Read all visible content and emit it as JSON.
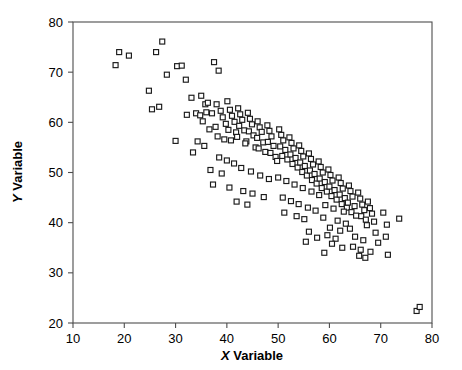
{
  "chart_data": {
    "type": "scatter",
    "title": "",
    "xlabel": "X Variable",
    "ylabel": "Y Variable",
    "xlabel_parts": {
      "italic": "X",
      "rest": " Variable"
    },
    "ylabel_parts": {
      "italic": "Y",
      "rest": " Variable"
    },
    "xlim": [
      10,
      80
    ],
    "ylim": [
      20,
      80
    ],
    "xticks": [
      10,
      20,
      30,
      40,
      50,
      60,
      70,
      80
    ],
    "yticks": [
      20,
      30,
      40,
      50,
      60,
      70,
      80
    ],
    "xtick_labels": [
      "10",
      "20",
      "30",
      "40",
      "50",
      "60",
      "70",
      "80"
    ],
    "ytick_labels": [
      "20",
      "30",
      "40",
      "50",
      "60",
      "70",
      "80"
    ],
    "grid": false,
    "legend": null,
    "marker": "open-square",
    "marker_size": 5,
    "marker_color": "#1a1a1a",
    "marker_fill": "#ffffff",
    "frame_color": "#4d4d4d",
    "correlation": "negative",
    "n_points": 202,
    "points": [
      [
        18.3,
        71.4
      ],
      [
        19.0,
        74.0
      ],
      [
        20.9,
        73.3
      ],
      [
        26.2,
        74.0
      ],
      [
        27.4,
        76.1
      ],
      [
        24.8,
        66.3
      ],
      [
        25.4,
        62.6
      ],
      [
        26.8,
        63.1
      ],
      [
        28.3,
        69.5
      ],
      [
        30.3,
        71.2
      ],
      [
        31.2,
        71.3
      ],
      [
        32.0,
        68.5
      ],
      [
        33.1,
        64.9
      ],
      [
        32.2,
        61.5
      ],
      [
        34.0,
        61.8
      ],
      [
        30.0,
        56.3
      ],
      [
        33.4,
        54.0
      ],
      [
        35.0,
        65.3
      ],
      [
        35.8,
        63.6
      ],
      [
        36.3,
        63.9
      ],
      [
        36.0,
        62.0
      ],
      [
        34.8,
        61.4
      ],
      [
        35.3,
        60.2
      ],
      [
        37.1,
        61.8
      ],
      [
        36.6,
        58.6
      ],
      [
        34.3,
        56.2
      ],
      [
        35.6,
        55.3
      ],
      [
        37.5,
        72.0
      ],
      [
        38.4,
        70.3
      ],
      [
        38.0,
        63.6
      ],
      [
        38.8,
        62.3
      ],
      [
        39.2,
        61.0
      ],
      [
        37.8,
        59.1
      ],
      [
        39.8,
        59.7
      ],
      [
        38.2,
        57.2
      ],
      [
        39.5,
        56.6
      ],
      [
        40.1,
        64.2
      ],
      [
        40.6,
        62.5
      ],
      [
        41.0,
        61.3
      ],
      [
        41.5,
        60.1
      ],
      [
        40.3,
        58.5
      ],
      [
        41.8,
        58.0
      ],
      [
        40.8,
        56.4
      ],
      [
        42.2,
        62.8
      ],
      [
        42.6,
        61.6
      ],
      [
        43.0,
        60.5
      ],
      [
        42.4,
        59.3
      ],
      [
        43.4,
        58.4
      ],
      [
        42.0,
        57.1
      ],
      [
        43.8,
        56.2
      ],
      [
        44.1,
        61.9
      ],
      [
        44.5,
        60.7
      ],
      [
        44.9,
        59.6
      ],
      [
        44.3,
        58.2
      ],
      [
        45.2,
        57.4
      ],
      [
        43.6,
        55.8
      ],
      [
        45.6,
        55.0
      ],
      [
        46.0,
        60.2
      ],
      [
        46.4,
        59.0
      ],
      [
        46.8,
        58.1
      ],
      [
        45.9,
        56.9
      ],
      [
        47.1,
        56.0
      ],
      [
        46.2,
        54.8
      ],
      [
        47.5,
        54.1
      ],
      [
        47.9,
        59.4
      ],
      [
        48.3,
        58.3
      ],
      [
        48.7,
        57.2
      ],
      [
        48.0,
        56.1
      ],
      [
        49.1,
        55.3
      ],
      [
        48.5,
        53.9
      ],
      [
        49.5,
        53.1
      ],
      [
        38.5,
        53.0
      ],
      [
        40.0,
        52.4
      ],
      [
        41.4,
        51.8
      ],
      [
        36.8,
        50.5
      ],
      [
        39.0,
        49.8
      ],
      [
        42.8,
        50.9
      ],
      [
        44.7,
        50.2
      ],
      [
        37.3,
        47.6
      ],
      [
        40.5,
        47.0
      ],
      [
        43.2,
        46.3
      ],
      [
        46.5,
        49.4
      ],
      [
        48.2,
        48.7
      ],
      [
        45.0,
        45.8
      ],
      [
        47.2,
        45.1
      ],
      [
        41.9,
        44.2
      ],
      [
        44.0,
        43.6
      ],
      [
        49.8,
        52.3
      ],
      [
        50.2,
        58.6
      ],
      [
        50.6,
        57.5
      ],
      [
        51.0,
        56.4
      ],
      [
        50.4,
        55.2
      ],
      [
        51.4,
        54.5
      ],
      [
        50.8,
        53.3
      ],
      [
        51.8,
        52.6
      ],
      [
        52.2,
        57.0
      ],
      [
        52.6,
        55.9
      ],
      [
        53.0,
        54.8
      ],
      [
        52.4,
        53.6
      ],
      [
        53.4,
        52.9
      ],
      [
        52.8,
        51.7
      ],
      [
        53.8,
        51.0
      ],
      [
        54.1,
        55.4
      ],
      [
        54.5,
        54.3
      ],
      [
        54.9,
        53.2
      ],
      [
        54.3,
        52.0
      ],
      [
        55.2,
        51.3
      ],
      [
        54.7,
        50.1
      ],
      [
        55.6,
        49.4
      ],
      [
        56.0,
        53.8
      ],
      [
        56.4,
        52.7
      ],
      [
        56.8,
        51.6
      ],
      [
        56.2,
        50.4
      ],
      [
        57.1,
        49.7
      ],
      [
        56.6,
        48.5
      ],
      [
        57.5,
        47.8
      ],
      [
        57.9,
        52.2
      ],
      [
        58.3,
        51.1
      ],
      [
        58.7,
        50.0
      ],
      [
        58.1,
        48.8
      ],
      [
        59.1,
        48.1
      ],
      [
        58.5,
        46.9
      ],
      [
        59.5,
        46.2
      ],
      [
        50.0,
        49.0
      ],
      [
        51.6,
        48.3
      ],
      [
        53.2,
        47.6
      ],
      [
        54.8,
        46.9
      ],
      [
        56.5,
        46.2
      ],
      [
        58.0,
        45.5
      ],
      [
        50.9,
        45.0
      ],
      [
        52.5,
        44.3
      ],
      [
        54.0,
        43.7
      ],
      [
        55.8,
        43.0
      ],
      [
        57.3,
        42.4
      ],
      [
        51.2,
        42.0
      ],
      [
        53.6,
        41.3
      ],
      [
        55.1,
        40.7
      ],
      [
        59.8,
        50.6
      ],
      [
        60.2,
        49.5
      ],
      [
        60.6,
        48.4
      ],
      [
        60.0,
        47.2
      ],
      [
        61.0,
        46.5
      ],
      [
        60.4,
        45.3
      ],
      [
        61.4,
        44.6
      ],
      [
        61.8,
        49.0
      ],
      [
        62.2,
        47.9
      ],
      [
        62.6,
        46.8
      ],
      [
        62.0,
        45.6
      ],
      [
        63.0,
        44.9
      ],
      [
        62.4,
        43.7
      ],
      [
        63.4,
        43.0
      ],
      [
        63.8,
        47.4
      ],
      [
        64.1,
        46.3
      ],
      [
        64.5,
        45.2
      ],
      [
        63.6,
        44.0
      ],
      [
        64.9,
        43.3
      ],
      [
        64.3,
        42.1
      ],
      [
        65.2,
        41.4
      ],
      [
        59.2,
        43.5
      ],
      [
        60.8,
        42.8
      ],
      [
        62.8,
        42.2
      ],
      [
        58.8,
        41.0
      ],
      [
        61.6,
        40.4
      ],
      [
        63.2,
        39.8
      ],
      [
        60.1,
        39.0
      ],
      [
        62.1,
        38.4
      ],
      [
        64.0,
        38.8
      ],
      [
        59.6,
        37.5
      ],
      [
        61.2,
        36.8
      ],
      [
        65.6,
        46.0
      ],
      [
        66.0,
        44.8
      ],
      [
        66.4,
        43.6
      ],
      [
        66.8,
        42.5
      ],
      [
        66.2,
        41.3
      ],
      [
        67.1,
        40.6
      ],
      [
        67.5,
        44.2
      ],
      [
        67.9,
        42.9
      ],
      [
        68.3,
        41.8
      ],
      [
        67.3,
        39.5
      ],
      [
        68.7,
        40.2
      ],
      [
        65.0,
        37.2
      ],
      [
        66.6,
        36.5
      ],
      [
        64.6,
        35.2
      ],
      [
        66.1,
        34.6
      ],
      [
        60.5,
        35.8
      ],
      [
        62.5,
        35.0
      ],
      [
        65.8,
        33.4
      ],
      [
        67.0,
        33.0
      ],
      [
        69.0,
        38.0
      ],
      [
        70.5,
        42.0
      ],
      [
        71.2,
        39.6
      ],
      [
        71.0,
        37.2
      ],
      [
        71.4,
        33.6
      ],
      [
        73.6,
        40.8
      ],
      [
        69.5,
        36.0
      ],
      [
        68.0,
        34.2
      ],
      [
        77.0,
        22.4
      ],
      [
        77.6,
        23.2
      ],
      [
        56.0,
        38.2
      ],
      [
        57.6,
        37.0
      ],
      [
        55.4,
        36.2
      ],
      [
        59.0,
        34.0
      ]
    ]
  },
  "axes": {
    "xlabel_display": "X Variable",
    "ylabel_display": "Y Variable"
  }
}
